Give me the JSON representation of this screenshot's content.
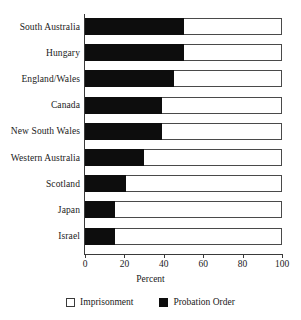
{
  "chart_data": {
    "type": "bar",
    "orientation": "horizontal",
    "stacked": true,
    "stacked_percent": true,
    "title": "",
    "subtitle": "",
    "xlabel": "Percent",
    "ylabel": "",
    "xlim": [
      0,
      100
    ],
    "xticks": [
      0,
      20,
      40,
      60,
      80,
      100
    ],
    "xtick_labels": [
      "0",
      "20",
      "40",
      "60",
      "80",
      "100"
    ],
    "grid": false,
    "legend_position": "bottom",
    "categories": [
      "South Australia",
      "Hungary",
      "England/Wales",
      "Canada",
      "New South Wales",
      "Western Australia",
      "Scotland",
      "Japan",
      "Israel"
    ],
    "series": [
      {
        "name": "Probation Order",
        "color": "#0d0d0d",
        "values": [
          50.5,
          50.5,
          45,
          39,
          39,
          30,
          21,
          15,
          15
        ]
      },
      {
        "name": "Imprisonment",
        "color": "#ffffff",
        "values": [
          49.5,
          49.5,
          55,
          61,
          61,
          70,
          79,
          85,
          85
        ]
      }
    ],
    "legend_entries": [
      {
        "label": "Imprisonment",
        "swatch": "white"
      },
      {
        "label": "Probation Order",
        "swatch": "black"
      }
    ]
  }
}
